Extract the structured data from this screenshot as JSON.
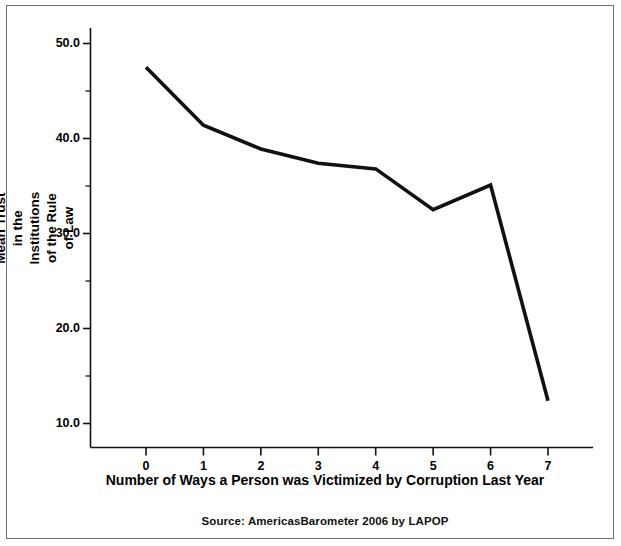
{
  "chart_data": {
    "type": "line",
    "title": "",
    "subtitle": "",
    "xlabel": "Number of Ways a Person was Victimized by Corruption Last Year",
    "ylabel": "Mean Trust in the Institutions of the Rule of Law",
    "source_note": "Source: AmericasBarometer 2006 by LAPOP",
    "x": [
      0,
      1,
      2,
      3,
      4,
      5,
      6,
      7
    ],
    "values": [
      47.5,
      41.4,
      38.9,
      37.4,
      36.8,
      32.5,
      35.1,
      12.4
    ],
    "categories": [
      "0",
      "1",
      "2",
      "3",
      "4",
      "5",
      "6",
      "7"
    ],
    "xtick_labels": [
      "0",
      "1",
      "2",
      "3",
      "4",
      "5",
      "6",
      "7"
    ],
    "ytick_labels": [
      "50.0",
      "40.0",
      "30.0",
      "20.0",
      "10.0"
    ],
    "ytick_values": [
      50.0,
      40.0,
      30.0,
      20.0,
      10.0
    ],
    "yminor_values": [
      45.0,
      35.0,
      25.0,
      15.0
    ],
    "xlim": [
      -0.35,
      7.45
    ],
    "ylim": [
      8.5,
      52.0
    ],
    "grid": false,
    "legend": false,
    "legend_position": "none",
    "line_color": "#111111",
    "background_color": "#ffffff",
    "frame_color": "#6e6e6e"
  }
}
